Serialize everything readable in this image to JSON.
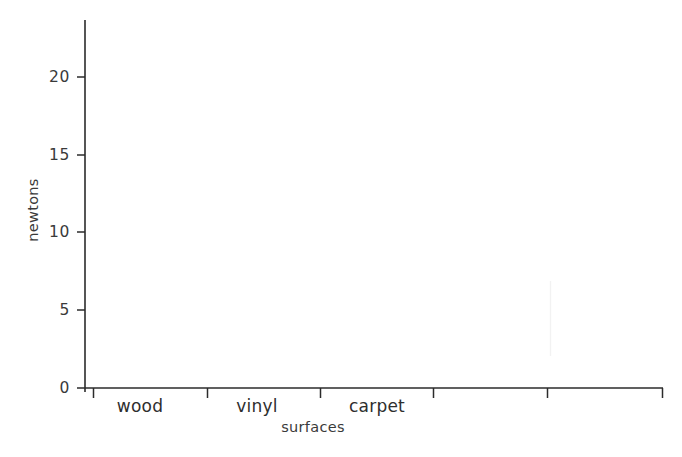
{
  "chart_data": {
    "type": "bar",
    "title": "",
    "subtitle": "",
    "xlabel": "surfaces",
    "ylabel": "newtons",
    "categories": [
      "wood",
      "vinyl",
      "carpet"
    ],
    "values": [
      0,
      0,
      0
    ],
    "series": [
      {
        "name": "newtons",
        "values": [
          0,
          0,
          0
        ]
      }
    ],
    "ylim": [
      0,
      23
    ],
    "y_ticks": [
      0,
      5,
      10,
      15,
      20
    ],
    "y_tick_labels": [
      "0",
      "5",
      "10",
      "15",
      "20"
    ],
    "x_tick_count": 6,
    "grid": false,
    "legend": false,
    "legend_position": "none",
    "annotations": []
  },
  "axes": {
    "y_axis_label": "newtons",
    "x_axis_label": "surfaces",
    "y_tick_labels": [
      "20",
      "15",
      "10",
      "5",
      "0"
    ],
    "x_tick_labels": [
      "wood",
      "vinyl",
      "carpet"
    ]
  },
  "colors": {
    "background": "#ffffff",
    "axis": "#2b2b2b",
    "text": "#3a3a3a",
    "tick_text": "#2e2e2e",
    "ghost": "#f2f2f2"
  },
  "geometry": {
    "width": 682,
    "height": 457,
    "plot_left": 85,
    "plot_right": 663,
    "baseline_y": 388,
    "plot_top": 20
  }
}
